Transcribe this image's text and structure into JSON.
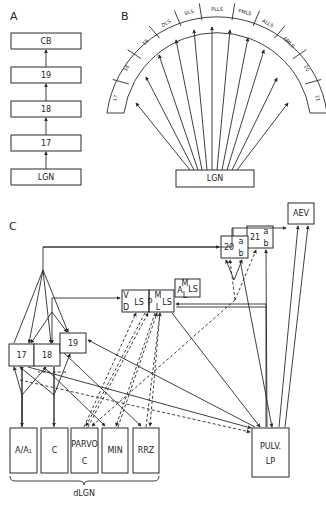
{
  "panels": {
    "A": {
      "label": "A",
      "hierarchy": [
        "LGN",
        "17",
        "18",
        "19",
        "CB"
      ]
    },
    "B": {
      "label": "B",
      "source": "LGN",
      "targets": [
        "17",
        "18",
        "19",
        "DLS",
        "VLS",
        "PLLS",
        "PMLS",
        "ALLS",
        "AMLS",
        "20",
        "21"
      ]
    },
    "C": {
      "label": "C",
      "areas": {
        "a17": "17",
        "a18": "18",
        "a19": "19",
        "vlsp_v": "V",
        "vlsp_d": "D",
        "vlsp_ls": "LS",
        "p": "P",
        "ml_m": "M",
        "ml_l": "L",
        "ml_ls": "LS",
        "aml_a": "A",
        "aml_m": "M",
        "aml_l": "L",
        "aml_ls": "LS",
        "a20": "20",
        "a20_a": "a",
        "a20_b": "b",
        "a21": "21",
        "a21_a": "a",
        "a21_b": "b",
        "aev": "AEV"
      },
      "dlgn_layers": [
        "A/A₁",
        "C",
        "C",
        "MIN",
        "RRZ"
      ],
      "dlgn_parvo_label": "PARVO",
      "dlgn_group_label": "dLGN",
      "pulvinar_label": "PULV.",
      "lp_label": "LP"
    }
  },
  "colors": {
    "line": "#2a2a2a",
    "background": "#ffffff"
  }
}
